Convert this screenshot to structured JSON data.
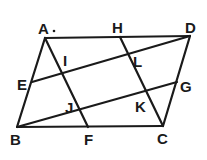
{
  "diagram": {
    "type": "geometry",
    "points": {
      "A": [
        45,
        38
      ],
      "D": [
        190,
        36
      ],
      "B": [
        17,
        127
      ],
      "C": [
        163,
        126
      ],
      "E": [
        32,
        82
      ],
      "H": [
        120,
        37
      ],
      "F": [
        88,
        127
      ],
      "G": [
        177,
        82
      ],
      "I": [
        62,
        70
      ],
      "L": [
        129,
        59
      ],
      "J": [
        80,
        110
      ],
      "K": [
        146,
        91
      ]
    },
    "labels": {
      "A": "A",
      "H": "H",
      "D": "D",
      "E": "E",
      "I": "I",
      "L": "L",
      "G": "G",
      "J": "J",
      "K": "K",
      "B": "B",
      "F": "F",
      "C": "C"
    },
    "segments": [
      [
        "A",
        "D"
      ],
      [
        "D",
        "C"
      ],
      [
        "C",
        "B"
      ],
      [
        "B",
        "A"
      ],
      [
        "A",
        "F"
      ],
      [
        "H",
        "C"
      ],
      [
        "E",
        "D"
      ],
      [
        "B",
        "G"
      ]
    ]
  }
}
